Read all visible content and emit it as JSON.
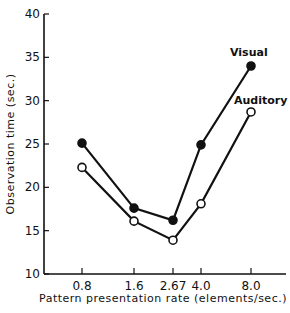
{
  "chart_data": {
    "type": "line",
    "title": "",
    "xlabel": "Pattern presentation rate (elements/sec.)",
    "ylabel": "Observation time (sec.)",
    "ylim": [
      10,
      40
    ],
    "yticks": [
      10,
      15,
      20,
      25,
      30,
      35,
      40
    ],
    "categories": [
      "0.8",
      "1.6",
      "2.67",
      "4.0",
      "8.0"
    ],
    "x": [
      0.8,
      1.6,
      2.67,
      4.0,
      8.0
    ],
    "grid": false,
    "legend": "inline labels at line ends",
    "series": [
      {
        "name": "Visual",
        "marker": "filled-circle",
        "values": [
          25.1,
          17.6,
          16.2,
          24.9,
          34.0
        ]
      },
      {
        "name": "Auditory",
        "marker": "open-circle",
        "values": [
          22.3,
          16.1,
          13.9,
          18.1,
          28.7
        ]
      }
    ]
  },
  "labels": {
    "ylabel": "Observation time (sec.)",
    "xlabel": "Pattern presentation rate (elements/sec.)",
    "visual": "Visual",
    "auditory": "Auditory"
  }
}
